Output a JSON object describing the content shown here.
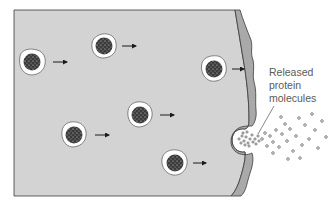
{
  "diagram": {
    "label": {
      "line1": "Released",
      "line2": "protein",
      "line3": "molecules"
    },
    "colors": {
      "cytoplasm": "#d3d3d3",
      "membrane": "#a9a9a9",
      "outline": "#3a3a3a",
      "vesicle_halo": "#ffffff",
      "vesicle_core": "#3b3b3b",
      "label_text": "#5a5a5a"
    },
    "vesicles": [
      {
        "id": "vesicle-1",
        "cx": 32,
        "cy": 62
      },
      {
        "id": "vesicle-2",
        "cx": 104,
        "cy": 46
      },
      {
        "id": "vesicle-3",
        "cx": 214,
        "cy": 69
      },
      {
        "id": "vesicle-4",
        "cx": 140,
        "cy": 115
      },
      {
        "id": "vesicle-5",
        "cx": 74,
        "cy": 135
      },
      {
        "id": "vesicle-6",
        "cx": 175,
        "cy": 163
      }
    ],
    "arrows": [
      {
        "from_x": 53,
        "to_x": 68,
        "y": 62
      },
      {
        "from_x": 122,
        "to_x": 137,
        "y": 46
      },
      {
        "from_x": 232,
        "to_x": 245,
        "y": 69
      },
      {
        "from_x": 160,
        "to_x": 175,
        "y": 115
      },
      {
        "from_x": 95,
        "to_x": 110,
        "y": 135
      },
      {
        "from_x": 193,
        "to_x": 207,
        "y": 163
      }
    ]
  }
}
